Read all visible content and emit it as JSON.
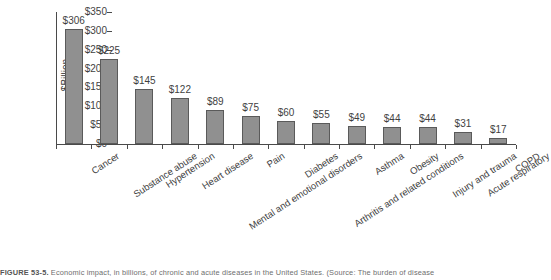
{
  "chart_data": {
    "type": "bar",
    "title": "",
    "xlabel": "",
    "ylabel": "$Billion",
    "ylim": [
      0,
      350
    ],
    "ytick_step": 50,
    "grid": false,
    "legend": "none",
    "value_prefix": "$",
    "categories": [
      "Cancer",
      "Substance abuse",
      "Hypertension",
      "Heart disease",
      "Mental and emotional disorders",
      "Pain",
      "Diabetes",
      "Arthritis and related conditions",
      "Asthma",
      "Obesity",
      "Injury and trauma",
      "Acute respiratory",
      "COPD"
    ],
    "values": [
      306,
      225,
      145,
      122,
      89,
      75,
      60,
      55,
      49,
      44,
      44,
      31,
      17
    ],
    "value_labels": [
      "$306",
      "$225",
      "$145",
      "$122",
      "$89",
      "$75",
      "$60",
      "$55",
      "$49",
      "$44",
      "$44",
      "$31",
      "$17"
    ],
    "ytick_labels": [
      "$0",
      "$50",
      "$100",
      "$150",
      "$200",
      "$250",
      "$300",
      "$350"
    ],
    "ytick_values": [
      0,
      50,
      100,
      150,
      200,
      250,
      300,
      350
    ],
    "bar_color": "#909090",
    "bar_border_color": "#5a5a5a",
    "axis_color": "#4a4a4a",
    "text_color": "#3f3f3f"
  },
  "caption": {
    "figure_number": "FIGURE 53-5.",
    "text": " Economic impact, in billions, of chronic and acute diseases in the United States. (Source: The burden of disease"
  }
}
